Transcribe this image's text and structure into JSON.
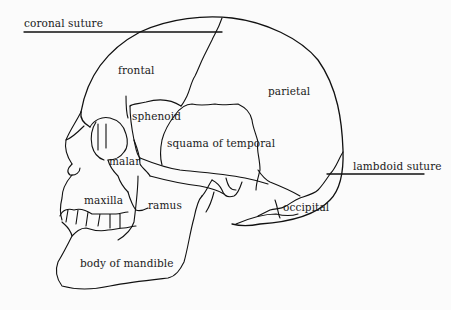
{
  "diagram": {
    "type": "anatomical-line-drawing",
    "line_color": "#111111",
    "background": "#fbfbfb"
  },
  "labels": {
    "coronal_suture": "coronal suture",
    "frontal": "frontal",
    "parietal": "parietal",
    "sphenoid": "sphenoid",
    "squama_of_temporal": "squama of temporal",
    "malar": "malar",
    "lambdoid_suture": "lambdoid suture",
    "maxilla": "maxilla",
    "ramus": "ramus",
    "occipital": "occipital",
    "body_of_mandible": "body of mandible"
  }
}
